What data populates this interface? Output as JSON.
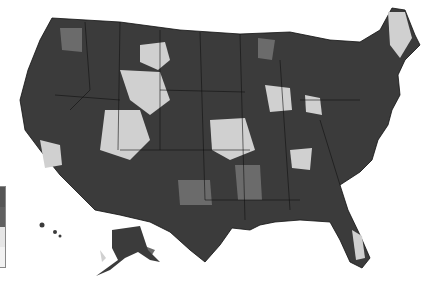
{
  "map": {
    "title": "",
    "type": "choropleth",
    "region": "United States (counties/regions)",
    "colors": {
      "dark": "#3a3a3a",
      "mid_dark": "#555555",
      "mid": "#7a7a7a",
      "light": "#d2d2d2",
      "border": "#111111",
      "background": "#ffffff"
    },
    "legend": {
      "swatches": [
        "#555555",
        "#555555",
        "#e6e6e6",
        "#f2f2f2"
      ]
    }
  }
}
